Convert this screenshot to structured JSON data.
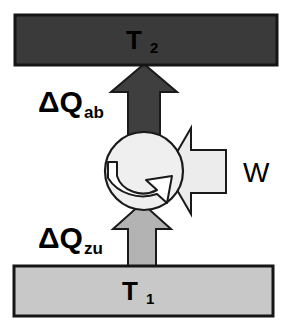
{
  "diagram": {
    "type": "schematic",
    "background_color": "#ffffff",
    "stroke_color": "#1a1a1a"
  },
  "hot_reservoir": {
    "name": "hot-reservoir",
    "label": "T",
    "subscript": "2",
    "fill_color": "#3a3a3a",
    "text_color": "#000000",
    "x": 15,
    "y": 15,
    "width": 262,
    "height": 50
  },
  "cold_reservoir": {
    "name": "cold-reservoir",
    "label": "T",
    "subscript": "1",
    "fill_color": "#c8c8c8",
    "text_color": "#000000",
    "x": 14,
    "y": 266,
    "width": 259,
    "height": 50
  },
  "heat_out": {
    "name": "heat-output-arrow",
    "label": "ΔQ",
    "subscript": "ab",
    "direction": "up",
    "fill_color": "#3f3f3f",
    "label_x": 38,
    "label_y": 112
  },
  "heat_in": {
    "name": "heat-input-arrow",
    "label": "ΔQ",
    "subscript": "zu",
    "direction": "up",
    "fill_color": "#b3b3b3",
    "label_x": 38,
    "label_y": 248
  },
  "work": {
    "name": "work-input-arrow",
    "label": "W",
    "direction": "left",
    "fill_color": "#ececec",
    "label_x": 246,
    "label_y": 175
  },
  "machine": {
    "name": "cycle-machine",
    "shape": "circle",
    "fill_color": "#efefef",
    "center_x": 144,
    "center_y": 171,
    "radius": 39,
    "rotation_arrow": {
      "name": "rotation-arrow",
      "direction": "clockwise",
      "fill_color": "#ffffff"
    }
  }
}
